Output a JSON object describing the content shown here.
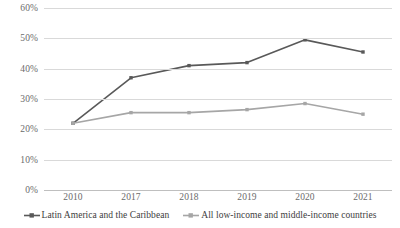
{
  "chart_data": {
    "type": "line",
    "title": "",
    "xlabel": "",
    "ylabel": "",
    "categories": [
      "2010",
      "2017",
      "2018",
      "2019",
      "2020",
      "2021"
    ],
    "ylim": [
      0,
      60
    ],
    "ytick_values": [
      0,
      10,
      20,
      30,
      40,
      50,
      60
    ],
    "ytick_labels": [
      "0%",
      "10%",
      "20%",
      "30%",
      "40%",
      "50%",
      "60%"
    ],
    "grid": "horizontal",
    "legend_position": "bottom",
    "series": [
      {
        "name": "Latin America and the Caribbean",
        "color": "#595959",
        "values": [
          22,
          37,
          41,
          42,
          49.5,
          45.5
        ]
      },
      {
        "name": "All low-income and middle-income countries",
        "color": "#a6a6a6",
        "values": [
          22,
          25.5,
          25.5,
          26.5,
          28.5,
          25
        ]
      }
    ]
  },
  "legend": {
    "entries": [
      {
        "label": "Latin America and the Caribbean",
        "marker": "line-marker-icon"
      },
      {
        "label": "All low-income and middle-income countries",
        "marker": "line-marker-icon"
      }
    ]
  }
}
